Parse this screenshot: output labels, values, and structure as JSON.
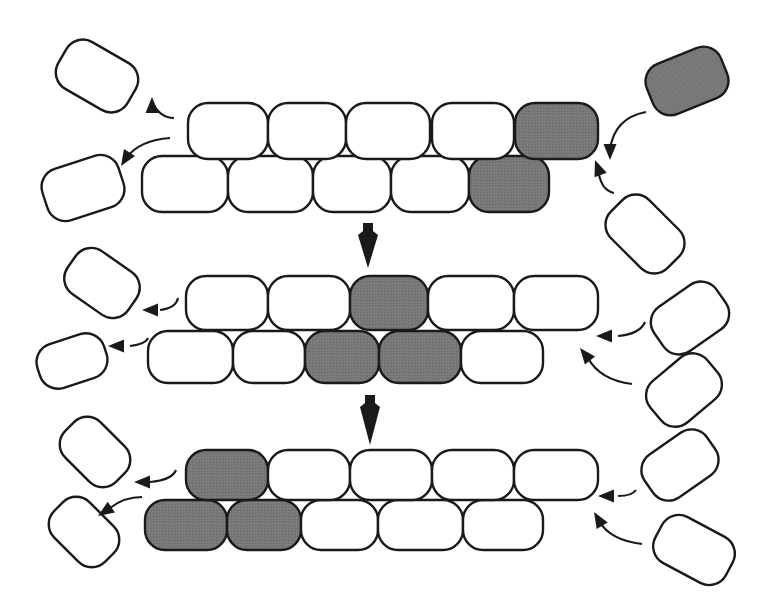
{
  "diagram": {
    "title": "",
    "colors": {
      "stroke": "#1a1a1a",
      "empty_fill": "#ffffff",
      "marked_fill": "#777777",
      "background": "#ffffff"
    },
    "stages": [
      {
        "id": "stage-1",
        "top_row": {
          "y": 103,
          "h": 56,
          "cells": [
            {
              "x": 188,
              "w": 80,
              "marked": false
            },
            {
              "x": 268,
              "w": 78,
              "marked": false
            },
            {
              "x": 346,
              "w": 84,
              "marked": false
            },
            {
              "x": 432,
              "w": 82,
              "marked": false
            },
            {
              "x": 515,
              "w": 83,
              "marked": true
            }
          ]
        },
        "bottom_row": {
          "y": 156,
          "h": 56,
          "cells": [
            {
              "x": 142,
              "w": 86,
              "marked": false
            },
            {
              "x": 228,
              "w": 85,
              "marked": false
            },
            {
              "x": 313,
              "w": 78,
              "marked": false
            },
            {
              "x": 391,
              "w": 78,
              "marked": false
            },
            {
              "x": 469,
              "w": 80,
              "marked": true
            }
          ]
        },
        "free_cells": [
          {
            "cx": 97,
            "cy": 76,
            "w": 80,
            "h": 54,
            "rot": 30,
            "marked": false
          },
          {
            "cx": 83,
            "cy": 188,
            "w": 80,
            "h": 54,
            "rot": -18,
            "marked": false
          },
          {
            "cx": 687,
            "cy": 81,
            "w": 80,
            "h": 54,
            "rot": -22,
            "marked": true
          },
          {
            "cx": 645,
            "cy": 234,
            "w": 80,
            "h": 54,
            "rot": 45,
            "marked": false
          }
        ],
        "arrows": [
          {
            "path": "M174 118 Q160 118 152 102",
            "head": [
              152,
              97
            ],
            "dir": "up-left"
          },
          {
            "path": "M170 138 Q140 140 126 158",
            "head": [
              121,
              166
            ],
            "dir": "down-left"
          },
          {
            "path": "M646 112 Q614 118 610 150",
            "head": [
              610,
              160
            ],
            "dir": "down"
          },
          {
            "path": "M614 193 Q600 190 598 168",
            "head": [
              595,
              160
            ],
            "dir": "up"
          }
        ]
      },
      {
        "id": "stage-2",
        "top_row": {
          "y": 276,
          "h": 54,
          "cells": [
            {
              "x": 186,
              "w": 82,
              "marked": false
            },
            {
              "x": 268,
              "w": 82,
              "marked": false
            },
            {
              "x": 350,
              "w": 78,
              "marked": true
            },
            {
              "x": 428,
              "w": 86,
              "marked": false
            },
            {
              "x": 514,
              "w": 84,
              "marked": false
            }
          ]
        },
        "bottom_row": {
          "y": 331,
          "h": 52,
          "cells": [
            {
              "x": 148,
              "w": 85,
              "marked": false
            },
            {
              "x": 233,
              "w": 72,
              "marked": false
            },
            {
              "x": 305,
              "w": 74,
              "marked": true
            },
            {
              "x": 379,
              "w": 82,
              "marked": true
            },
            {
              "x": 461,
              "w": 82,
              "marked": false
            }
          ]
        },
        "free_cells": [
          {
            "cx": 102,
            "cy": 283,
            "w": 74,
            "h": 52,
            "rot": 35,
            "marked": false
          },
          {
            "cx": 72,
            "cy": 361,
            "w": 70,
            "h": 46,
            "rot": -18,
            "marked": false
          },
          {
            "cx": 690,
            "cy": 318,
            "w": 76,
            "h": 54,
            "rot": -35,
            "marked": false
          },
          {
            "cx": 684,
            "cy": 390,
            "w": 74,
            "h": 54,
            "rot": -40,
            "marked": false
          }
        ],
        "arrows": [
          {
            "path": "M178 298 Q176 308 160 310",
            "head": [
              142,
              310
            ],
            "dir": "left"
          },
          {
            "path": "M148 338 Q146 344 130 346",
            "head": [
              108,
              346
            ],
            "dir": "left"
          },
          {
            "path": "M645 322 Q640 334 618 336",
            "head": [
              596,
              336
            ],
            "dir": "left"
          },
          {
            "path": "M632 384 Q600 380 588 358",
            "head": [
              580,
              348
            ],
            "dir": "up-left"
          }
        ]
      },
      {
        "id": "stage-3",
        "top_row": {
          "y": 450,
          "h": 50,
          "cells": [
            {
              "x": 186,
              "w": 82,
              "marked": true
            },
            {
              "x": 268,
              "w": 82,
              "marked": false
            },
            {
              "x": 350,
              "w": 82,
              "marked": false
            },
            {
              "x": 432,
              "w": 82,
              "marked": false
            },
            {
              "x": 514,
              "w": 84,
              "marked": false
            }
          ]
        },
        "bottom_row": {
          "y": 500,
          "h": 50,
          "cells": [
            {
              "x": 145,
              "w": 82,
              "marked": true
            },
            {
              "x": 227,
              "w": 74,
              "marked": true
            },
            {
              "x": 301,
              "w": 77,
              "marked": false
            },
            {
              "x": 378,
              "w": 85,
              "marked": false
            },
            {
              "x": 463,
              "w": 80,
              "marked": false
            }
          ]
        },
        "free_cells": [
          {
            "cx": 95,
            "cy": 452,
            "w": 72,
            "h": 50,
            "rot": 45,
            "marked": false
          },
          {
            "cx": 84,
            "cy": 532,
            "w": 72,
            "h": 50,
            "rot": 45,
            "marked": false
          },
          {
            "cx": 680,
            "cy": 465,
            "w": 76,
            "h": 52,
            "rot": -35,
            "marked": false
          },
          {
            "cx": 694,
            "cy": 550,
            "w": 80,
            "h": 52,
            "rot": 28,
            "marked": false
          }
        ],
        "arrows": [
          {
            "path": "M176 470 Q172 480 150 482",
            "head": [
              134,
              482
            ],
            "dir": "left"
          },
          {
            "path": "M142 497 Q124 497 110 508",
            "head": [
              98,
              516
            ],
            "dir": "down-left"
          },
          {
            "path": "M636 490 Q632 496 618 496",
            "head": [
              598,
              496
            ],
            "dir": "left"
          },
          {
            "path": "M642 544 Q610 540 600 522",
            "head": [
              594,
              512
            ],
            "dir": "up-left"
          }
        ]
      }
    ],
    "transitions": [
      {
        "from": "stage-1",
        "to": "stage-2",
        "x": 368,
        "y1": 223,
        "y2": 268
      },
      {
        "from": "stage-2",
        "to": "stage-3",
        "x": 370,
        "y1": 395,
        "y2": 445
      }
    ]
  }
}
